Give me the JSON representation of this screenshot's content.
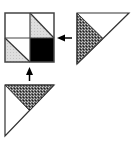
{
  "diagram": {
    "colors": {
      "stroke": "#333333",
      "black_fill": "#000000",
      "light_gray_fill": "#d9d9d9",
      "dark_stipple_fill": "#4a4a4a",
      "white": "#ffffff"
    },
    "square": {
      "cells": [
        {
          "position": "top-left",
          "fill": "white"
        },
        {
          "position": "top-right",
          "fill": "diagonal split, lower-left light gray"
        },
        {
          "position": "bottom-left",
          "fill": "diagonal split, lower-left light gray"
        },
        {
          "position": "bottom-right",
          "fill": "black"
        }
      ]
    },
    "right_triangle": {
      "shaded_part": "left sub-triangle, dark stipple"
    },
    "bottom_triangle": {
      "shaded_part": "top sub-triangle, dark stipple"
    },
    "arrows": [
      {
        "from": "right_triangle",
        "to": "square",
        "direction": "left"
      },
      {
        "from": "bottom_triangle",
        "to": "square",
        "direction": "up"
      }
    ]
  }
}
